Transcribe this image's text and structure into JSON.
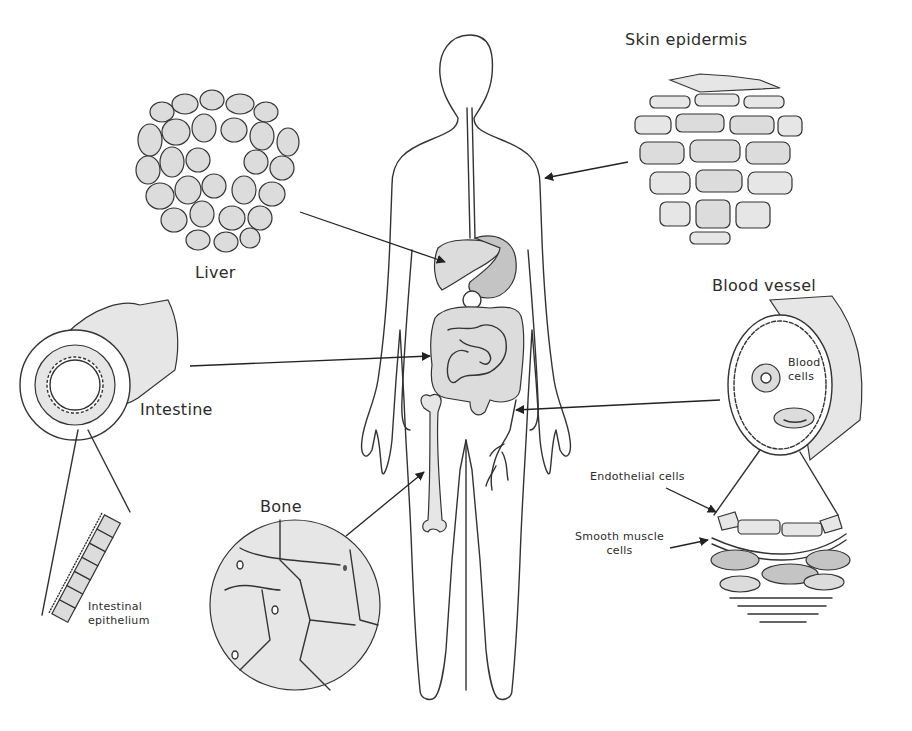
{
  "figure": {
    "style": "hand-drawn pencil illustration",
    "colors": {
      "background": "#ffffff",
      "ink": "#333333",
      "shade": "#dcdcdc",
      "dark_shade": "#c4c4c4"
    }
  },
  "body": {
    "label": "",
    "description": "Human body outline with esophagus, liver, stomach, intestines, femur and leg vein"
  },
  "labels": {
    "skin": "Skin epidermis",
    "liver": "Liver",
    "blood_vessel": "Blood vessel",
    "blood_cells_line1": "Blood",
    "blood_cells_line2": "cells",
    "intestine": "Intestine",
    "intestinal_epithelium_line1": "Intestinal",
    "intestinal_epithelium_line2": "epithelium",
    "bone": "Bone",
    "endothelial": "Endothelial cells",
    "smooth_muscle_line1": "Smooth muscle",
    "smooth_muscle_line2": "cells"
  },
  "callouts": [
    {
      "tissue": "Liver",
      "points_to": "liver organ"
    },
    {
      "tissue": "Skin epidermis",
      "points_to": "body outline (arm/torso skin)"
    },
    {
      "tissue": "Intestine",
      "points_to": "intestines"
    },
    {
      "tissue": "Blood vessel",
      "points_to": "leg vein"
    },
    {
      "tissue": "Bone",
      "points_to": "femur"
    },
    {
      "tissue": "Intestinal epithelium",
      "points_to": "intestine cross-section zoom"
    },
    {
      "tissue": "Endothelial cells",
      "points_to": "blood vessel wall zoom"
    },
    {
      "tissue": "Smooth muscle cells",
      "points_to": "blood vessel wall zoom"
    }
  ]
}
